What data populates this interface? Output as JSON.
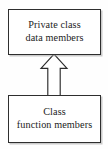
{
  "diagram": {
    "type": "uml-class-relationship",
    "background_color": "#fefefe",
    "line_color": "#2e2e2e",
    "text_color": "#1c1c1c",
    "nodes": [
      {
        "id": "private-data-members",
        "lines": [
          "Private class",
          "data members"
        ],
        "line1": "Private class",
        "line2": "data members"
      },
      {
        "id": "class-function-members",
        "lines": [
          "Class",
          "function members"
        ],
        "line1": "Class",
        "line2": "function members"
      }
    ],
    "connector": {
      "name": "hollow-up-arrow",
      "style": "open-triangle",
      "direction": "up",
      "from": "class-function-members",
      "to": "private-data-members",
      "fill": "#ffffff",
      "stroke": "#2b2b2b"
    }
  }
}
